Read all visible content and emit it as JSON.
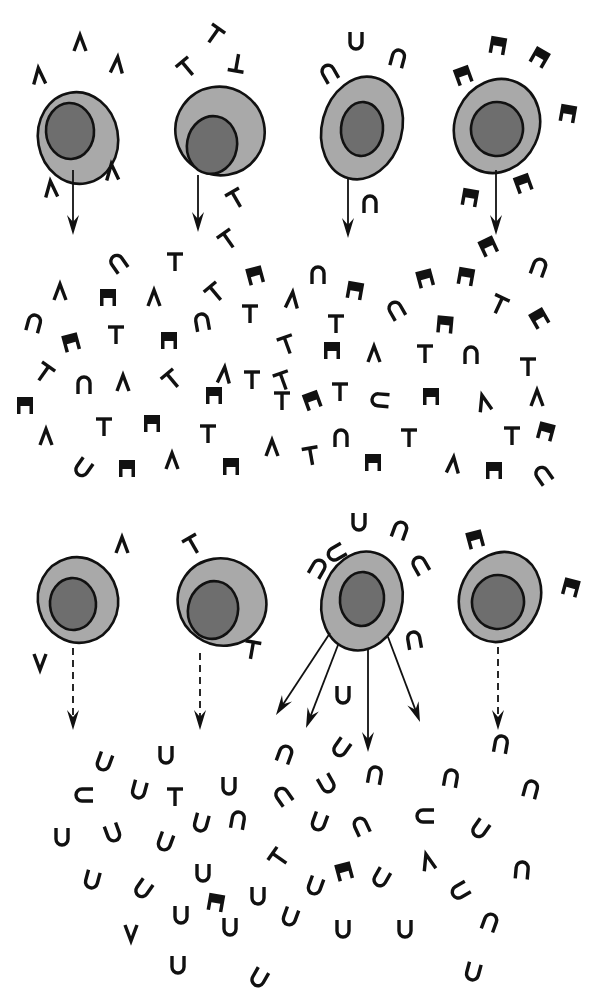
{
  "diagram": {
    "title": "",
    "colors": {
      "cytoplasm": "#a9a9a9",
      "nucleus": "#6e6e6e",
      "outline": "#111111",
      "background": "#ffffff"
    },
    "glyph_types": {
      "caret": "wedge-shaped receptor (Λ)",
      "tee": "T-shaped receptor",
      "arch": "U/∩-shaped receptor",
      "block": "solid notched block receptor"
    },
    "top_row": {
      "cells": [
        {
          "id": "cell-1",
          "cx": 78,
          "cy": 138,
          "rx": 40,
          "ry": 46,
          "rot": -10,
          "nx": 70,
          "ny": 131,
          "nrx": 24,
          "nry": 28,
          "receptor": "caret"
        },
        {
          "id": "cell-2",
          "cx": 220,
          "cy": 131,
          "rx": 45,
          "ry": 44,
          "rot": 35,
          "nx": 212,
          "ny": 145,
          "nrx": 25,
          "nry": 29,
          "receptor": "tee"
        },
        {
          "id": "cell-3",
          "cx": 362,
          "cy": 128,
          "rx": 40,
          "ry": 52,
          "rot": 15,
          "nx": 362,
          "ny": 129,
          "nrx": 21,
          "nry": 27,
          "receptor": "arch"
        },
        {
          "id": "cell-4",
          "cx": 497,
          "cy": 126,
          "rx": 42,
          "ry": 48,
          "rot": 25,
          "nx": 497,
          "ny": 129,
          "nrx": 26,
          "nry": 27,
          "receptor": "block"
        }
      ],
      "arrows": [
        {
          "x1": 73,
          "y1": 170,
          "x2": 73,
          "y2": 235,
          "dashed": false
        },
        {
          "x1": 198,
          "y1": 175,
          "x2": 198,
          "y2": 232,
          "dashed": false
        },
        {
          "x1": 348,
          "y1": 178,
          "x2": 348,
          "y2": 238,
          "dashed": false
        },
        {
          "x1": 496,
          "y1": 170,
          "x2": 496,
          "y2": 235,
          "dashed": false
        }
      ]
    },
    "bottom_row": {
      "cells": [
        {
          "id": "cell-5",
          "cx": 78,
          "cy": 600,
          "rx": 40,
          "ry": 43,
          "rot": -15,
          "nx": 73,
          "ny": 604,
          "nrx": 23,
          "nry": 26,
          "receptor": "caret"
        },
        {
          "id": "cell-6",
          "cx": 222,
          "cy": 602,
          "rx": 45,
          "ry": 43,
          "rot": 35,
          "nx": 213,
          "ny": 610,
          "nrx": 25,
          "nry": 29,
          "receptor": "tee"
        },
        {
          "id": "cell-7",
          "cx": 362,
          "cy": 601,
          "rx": 40,
          "ry": 50,
          "rot": 15,
          "nx": 362,
          "ny": 599,
          "nrx": 22,
          "nry": 27,
          "receptor": "arch"
        },
        {
          "id": "cell-8",
          "cx": 500,
          "cy": 597,
          "rx": 40,
          "ry": 46,
          "rot": 25,
          "nx": 498,
          "ny": 602,
          "nrx": 26,
          "nry": 27,
          "receptor": "block"
        }
      ],
      "arrows": [
        {
          "x1": 73,
          "y1": 648,
          "x2": 73,
          "y2": 730,
          "dashed": true
        },
        {
          "x1": 200,
          "y1": 653,
          "x2": 200,
          "y2": 730,
          "dashed": true
        },
        {
          "x1": 330,
          "y1": 633,
          "x2": 276,
          "y2": 715,
          "dashed": false
        },
        {
          "x1": 338,
          "y1": 645,
          "x2": 306,
          "y2": 728,
          "dashed": false
        },
        {
          "x1": 368,
          "y1": 650,
          "x2": 368,
          "y2": 752,
          "dashed": false
        },
        {
          "x1": 388,
          "y1": 637,
          "x2": 420,
          "y2": 722,
          "dashed": false
        },
        {
          "x1": 498,
          "y1": 647,
          "x2": 498,
          "y2": 730,
          "dashed": true
        }
      ]
    },
    "glyphs": [
      {
        "t": "caret",
        "x": 39,
        "y": 76,
        "r": -5
      },
      {
        "t": "caret",
        "x": 80,
        "y": 43,
        "r": 0
      },
      {
        "t": "caret",
        "x": 117,
        "y": 65,
        "r": 5
      },
      {
        "t": "caret",
        "x": 112,
        "y": 172,
        "r": -5
      },
      {
        "t": "caret",
        "x": 51,
        "y": 189,
        "r": -5
      },
      {
        "t": "tee",
        "x": 214,
        "y": 35,
        "r": 35
      },
      {
        "t": "tee",
        "x": 187,
        "y": 68,
        "r": -40
      },
      {
        "t": "tee",
        "x": 237,
        "y": 63,
        "r": 190
      },
      {
        "t": "tee",
        "x": 236,
        "y": 199,
        "r": -30
      },
      {
        "t": "tee",
        "x": 228,
        "y": 240,
        "r": -35
      },
      {
        "t": "arch",
        "x": 329,
        "y": 73,
        "r": -30
      },
      {
        "t": "arch",
        "x": 356,
        "y": 41,
        "r": 180
      },
      {
        "t": "arch",
        "x": 398,
        "y": 58,
        "r": 15
      },
      {
        "t": "arch",
        "x": 370,
        "y": 204,
        "r": 0
      },
      {
        "t": "block",
        "x": 498,
        "y": 45,
        "r": 10
      },
      {
        "t": "block",
        "x": 540,
        "y": 57,
        "r": 30
      },
      {
        "t": "block",
        "x": 463,
        "y": 75,
        "r": -20
      },
      {
        "t": "block",
        "x": 568,
        "y": 113,
        "r": 10
      },
      {
        "t": "block",
        "x": 523,
        "y": 183,
        "r": -20
      },
      {
        "t": "block",
        "x": 470,
        "y": 197,
        "r": 10
      },
      {
        "t": "block",
        "x": 488,
        "y": 246,
        "r": -25
      },
      {
        "t": "arch",
        "x": 118,
        "y": 263,
        "r": -35
      },
      {
        "t": "tee",
        "x": 175,
        "y": 262,
        "r": 0
      },
      {
        "t": "block",
        "x": 255,
        "y": 275,
        "r": -15
      },
      {
        "t": "arch",
        "x": 318,
        "y": 275,
        "r": 0
      },
      {
        "t": "block",
        "x": 355,
        "y": 290,
        "r": 10
      },
      {
        "t": "block",
        "x": 425,
        "y": 278,
        "r": -15
      },
      {
        "t": "block",
        "x": 466,
        "y": 276,
        "r": 10
      },
      {
        "t": "arch",
        "x": 539,
        "y": 267,
        "r": 20
      },
      {
        "t": "caret",
        "x": 60,
        "y": 292,
        "r": 0
      },
      {
        "t": "block",
        "x": 108,
        "y": 297,
        "r": 0
      },
      {
        "t": "caret",
        "x": 154,
        "y": 298,
        "r": 0
      },
      {
        "t": "tee",
        "x": 215,
        "y": 293,
        "r": -40
      },
      {
        "t": "caret",
        "x": 292,
        "y": 300,
        "r": 5
      },
      {
        "t": "arch",
        "x": 396,
        "y": 310,
        "r": -30
      },
      {
        "t": "tee",
        "x": 499,
        "y": 305,
        "r": 25
      },
      {
        "t": "block",
        "x": 539,
        "y": 318,
        "r": -30
      },
      {
        "t": "arch",
        "x": 34,
        "y": 323,
        "r": 15
      },
      {
        "t": "block",
        "x": 71,
        "y": 342,
        "r": -15
      },
      {
        "t": "tee",
        "x": 116,
        "y": 335,
        "r": 0
      },
      {
        "t": "block",
        "x": 169,
        "y": 340,
        "r": 0
      },
      {
        "t": "arch",
        "x": 202,
        "y": 322,
        "r": -10
      },
      {
        "t": "tee",
        "x": 250,
        "y": 314,
        "r": 0
      },
      {
        "t": "tee",
        "x": 287,
        "y": 345,
        "r": -20
      },
      {
        "t": "tee",
        "x": 336,
        "y": 324,
        "r": 0
      },
      {
        "t": "block",
        "x": 445,
        "y": 324,
        "r": 5
      },
      {
        "t": "block",
        "x": 332,
        "y": 350,
        "r": 0
      },
      {
        "t": "caret",
        "x": 374,
        "y": 354,
        "r": 0
      },
      {
        "t": "tee",
        "x": 425,
        "y": 354,
        "r": 0
      },
      {
        "t": "arch",
        "x": 471,
        "y": 355,
        "r": 0
      },
      {
        "t": "tee",
        "x": 528,
        "y": 367,
        "r": 0
      },
      {
        "t": "tee",
        "x": 44,
        "y": 373,
        "r": 35
      },
      {
        "t": "arch",
        "x": 84,
        "y": 385,
        "r": 0
      },
      {
        "t": "caret",
        "x": 123,
        "y": 383,
        "r": 0
      },
      {
        "t": "tee",
        "x": 172,
        "y": 380,
        "r": -40
      },
      {
        "t": "caret",
        "x": 224,
        "y": 375,
        "r": 5
      },
      {
        "t": "tee",
        "x": 283,
        "y": 381,
        "r": -20
      },
      {
        "t": "block",
        "x": 312,
        "y": 400,
        "r": -20
      },
      {
        "t": "tee",
        "x": 340,
        "y": 392,
        "r": 0
      },
      {
        "t": "arch",
        "x": 380,
        "y": 400,
        "r": -85
      },
      {
        "t": "block",
        "x": 431,
        "y": 396,
        "r": 0
      },
      {
        "t": "caret",
        "x": 484,
        "y": 403,
        "r": -15
      },
      {
        "t": "caret",
        "x": 537,
        "y": 398,
        "r": 0
      },
      {
        "t": "block",
        "x": 25,
        "y": 405,
        "r": 0
      },
      {
        "t": "block",
        "x": 214,
        "y": 395,
        "r": 0
      },
      {
        "t": "tee",
        "x": 282,
        "y": 401,
        "r": 0
      },
      {
        "t": "tee",
        "x": 252,
        "y": 380,
        "r": 0
      },
      {
        "t": "caret",
        "x": 46,
        "y": 437,
        "r": 0
      },
      {
        "t": "tee",
        "x": 104,
        "y": 427,
        "r": 0
      },
      {
        "t": "block",
        "x": 152,
        "y": 423,
        "r": 0
      },
      {
        "t": "tee",
        "x": 208,
        "y": 434,
        "r": 0
      },
      {
        "t": "caret",
        "x": 272,
        "y": 448,
        "r": 0
      },
      {
        "t": "tee",
        "x": 311,
        "y": 456,
        "r": -10
      },
      {
        "t": "arch",
        "x": 341,
        "y": 438,
        "r": 0
      },
      {
        "t": "tee",
        "x": 409,
        "y": 438,
        "r": 0
      },
      {
        "t": "caret",
        "x": 453,
        "y": 465,
        "r": 5
      },
      {
        "t": "tee",
        "x": 512,
        "y": 436,
        "r": 0
      },
      {
        "t": "block",
        "x": 546,
        "y": 431,
        "r": 15
      },
      {
        "t": "arch",
        "x": 83,
        "y": 468,
        "r": -145
      },
      {
        "t": "block",
        "x": 127,
        "y": 468,
        "r": 0
      },
      {
        "t": "caret",
        "x": 172,
        "y": 461,
        "r": 0
      },
      {
        "t": "block",
        "x": 231,
        "y": 466,
        "r": 0
      },
      {
        "t": "block",
        "x": 373,
        "y": 462,
        "r": 0
      },
      {
        "t": "block",
        "x": 494,
        "y": 470,
        "r": 0
      },
      {
        "t": "arch",
        "x": 543,
        "y": 475,
        "r": -35
      },
      {
        "t": "caret",
        "x": 122,
        "y": 545,
        "r": 0
      },
      {
        "t": "tee",
        "x": 193,
        "y": 545,
        "r": -30
      },
      {
        "t": "arch",
        "x": 318,
        "y": 568,
        "r": 30
      },
      {
        "t": "arch",
        "x": 336,
        "y": 553,
        "r": -120
      },
      {
        "t": "arch",
        "x": 359,
        "y": 522,
        "r": 180
      },
      {
        "t": "arch",
        "x": 400,
        "y": 530,
        "r": 20
      },
      {
        "t": "arch",
        "x": 420,
        "y": 565,
        "r": -30
      },
      {
        "t": "block",
        "x": 475,
        "y": 539,
        "r": -15
      },
      {
        "t": "block",
        "x": 571,
        "y": 587,
        "r": 15
      },
      {
        "t": "tee",
        "x": 252,
        "y": 650,
        "r": 10
      },
      {
        "t": "caret",
        "x": 40,
        "y": 662,
        "r": 180
      },
      {
        "t": "arch",
        "x": 414,
        "y": 640,
        "r": -10
      },
      {
        "t": "arch",
        "x": 343,
        "y": 695,
        "r": 180
      },
      {
        "t": "arch",
        "x": 104,
        "y": 762,
        "r": 200
      },
      {
        "t": "arch",
        "x": 166,
        "y": 755,
        "r": 180
      },
      {
        "t": "arch",
        "x": 285,
        "y": 754,
        "r": 20
      },
      {
        "t": "arch",
        "x": 341,
        "y": 748,
        "r": -145
      },
      {
        "t": "arch",
        "x": 501,
        "y": 744,
        "r": 10
      },
      {
        "t": "arch",
        "x": 84,
        "y": 795,
        "r": -90
      },
      {
        "t": "arch",
        "x": 139,
        "y": 790,
        "r": 195
      },
      {
        "t": "tee",
        "x": 175,
        "y": 797,
        "r": 0
      },
      {
        "t": "arch",
        "x": 229,
        "y": 786,
        "r": 180
      },
      {
        "t": "arch",
        "x": 283,
        "y": 796,
        "r": -35
      },
      {
        "t": "arch",
        "x": 327,
        "y": 784,
        "r": 150
      },
      {
        "t": "arch",
        "x": 375,
        "y": 775,
        "r": 10
      },
      {
        "t": "arch",
        "x": 451,
        "y": 778,
        "r": 10
      },
      {
        "t": "arch",
        "x": 531,
        "y": 789,
        "r": 15
      },
      {
        "t": "arch",
        "x": 62,
        "y": 837,
        "r": 180
      },
      {
        "t": "arch",
        "x": 113,
        "y": 833,
        "r": 160
      },
      {
        "t": "arch",
        "x": 165,
        "y": 842,
        "r": 200
      },
      {
        "t": "arch",
        "x": 201,
        "y": 823,
        "r": 195
      },
      {
        "t": "arch",
        "x": 238,
        "y": 820,
        "r": 10
      },
      {
        "t": "tee",
        "x": 279,
        "y": 858,
        "r": -55
      },
      {
        "t": "arch",
        "x": 319,
        "y": 822,
        "r": 200
      },
      {
        "t": "arch",
        "x": 361,
        "y": 826,
        "r": -25
      },
      {
        "t": "arch",
        "x": 425,
        "y": 816,
        "r": -90
      },
      {
        "t": "arch",
        "x": 480,
        "y": 829,
        "r": -145
      },
      {
        "t": "arch",
        "x": 92,
        "y": 880,
        "r": 195
      },
      {
        "t": "arch",
        "x": 143,
        "y": 889,
        "r": -145
      },
      {
        "t": "arch",
        "x": 203,
        "y": 873,
        "r": 180
      },
      {
        "t": "block",
        "x": 216,
        "y": 902,
        "r": 10
      },
      {
        "t": "arch",
        "x": 258,
        "y": 896,
        "r": 180
      },
      {
        "t": "arch",
        "x": 315,
        "y": 886,
        "r": 200
      },
      {
        "t": "block",
        "x": 344,
        "y": 871,
        "r": -15
      },
      {
        "t": "arch",
        "x": 381,
        "y": 878,
        "r": 210
      },
      {
        "t": "caret",
        "x": 428,
        "y": 862,
        "r": -15
      },
      {
        "t": "arch",
        "x": 460,
        "y": 891,
        "r": -120
      },
      {
        "t": "arch",
        "x": 522,
        "y": 870,
        "r": 5
      },
      {
        "t": "arch",
        "x": 290,
        "y": 917,
        "r": 200
      },
      {
        "t": "caret",
        "x": 131,
        "y": 933,
        "r": 180
      },
      {
        "t": "arch",
        "x": 181,
        "y": 915,
        "r": 180
      },
      {
        "t": "arch",
        "x": 230,
        "y": 927,
        "r": 180
      },
      {
        "t": "arch",
        "x": 343,
        "y": 929,
        "r": 180
      },
      {
        "t": "arch",
        "x": 405,
        "y": 929,
        "r": 180
      },
      {
        "t": "arch",
        "x": 490,
        "y": 922,
        "r": 20
      },
      {
        "t": "arch",
        "x": 178,
        "y": 965,
        "r": 180
      },
      {
        "t": "arch",
        "x": 259,
        "y": 978,
        "r": 210
      },
      {
        "t": "arch",
        "x": 473,
        "y": 972,
        "r": 195
      }
    ]
  }
}
